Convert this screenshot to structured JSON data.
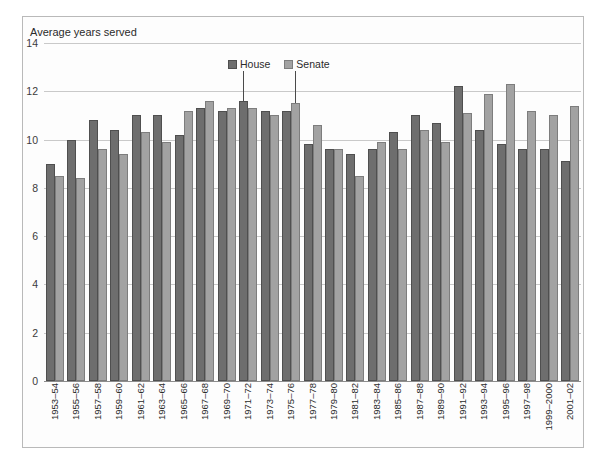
{
  "chart_data": {
    "type": "bar",
    "title": "",
    "ylabel": "Average years served",
    "xlabel": "",
    "ylim": [
      0,
      14
    ],
    "yticks": [
      0,
      2,
      4,
      6,
      8,
      10,
      12,
      14
    ],
    "grid": true,
    "legend_position": "inside-top-center",
    "categories": [
      "1953–54",
      "1955–56",
      "1957–58",
      "1959–60",
      "1961–62",
      "1963–64",
      "1965–66",
      "1967–68",
      "1969–70",
      "1971–72",
      "1973–74",
      "1975–76",
      "1977–78",
      "1979–80",
      "1981–82",
      "1983–84",
      "1985–86",
      "1987–88",
      "1989–90",
      "1991–92",
      "1993–94",
      "1995–96",
      "1997–98",
      "1999–2000",
      "2001–02"
    ],
    "series": [
      {
        "name": "House",
        "color": "#6e6e6e",
        "values": [
          9.0,
          10.0,
          10.8,
          10.4,
          11.0,
          11.0,
          10.2,
          11.3,
          11.2,
          11.6,
          11.2,
          11.2,
          9.8,
          9.6,
          9.4,
          9.6,
          10.3,
          11.0,
          10.7,
          12.2,
          10.4,
          9.8,
          9.6,
          9.6,
          9.1
        ]
      },
      {
        "name": "Senate",
        "color": "#a2a2a2",
        "values": [
          8.5,
          8.4,
          9.6,
          9.4,
          10.3,
          9.9,
          11.2,
          11.6,
          11.3,
          11.3,
          11.0,
          11.5,
          10.6,
          9.6,
          8.5,
          9.9,
          9.6,
          10.4,
          9.9,
          11.1,
          11.9,
          12.3,
          11.2,
          11.0,
          11.4
        ]
      }
    ]
  },
  "legend": {
    "entries": [
      {
        "label": "House",
        "swatch": "house-swatch"
      },
      {
        "label": "Senate",
        "swatch": "senate-swatch"
      }
    ]
  },
  "axis": {
    "y_title": "Average years served"
  }
}
